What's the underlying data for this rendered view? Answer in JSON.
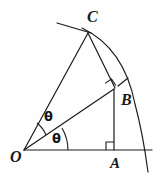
{
  "figure": {
    "stroke_color": "#1a1a1a",
    "background_color": "#fefefe",
    "width": 157,
    "height": 176,
    "points": [
      {
        "name": "O",
        "label": "O",
        "x": 24,
        "y": 150,
        "role": "origin-vertex"
      },
      {
        "name": "C",
        "label": "C",
        "x": 88,
        "y": 33,
        "role": "arc-point-outer"
      },
      {
        "name": "B",
        "label": "B",
        "x": 114,
        "y": 89,
        "role": "foot-of-perpendicular"
      },
      {
        "name": "A",
        "label": "A",
        "x": 114,
        "y": 150,
        "role": "foot-on-baseline"
      }
    ],
    "angles": [
      {
        "name": "theta-upper",
        "label": "θ",
        "vertex": "O",
        "between": "OB-and-OC"
      },
      {
        "name": "theta-lower",
        "label": "θ",
        "vertex": "O",
        "between": "OA-and-OB"
      }
    ],
    "right_angles": [
      {
        "name": "right-angle-at-A",
        "at": "A",
        "marker": "square"
      },
      {
        "name": "right-angle-at-B",
        "at": "B",
        "marker": "square"
      }
    ],
    "segments": [
      {
        "name": "segment-OC",
        "from": "O",
        "to": "C"
      },
      {
        "name": "segment-OB",
        "from": "O",
        "to": "B"
      },
      {
        "name": "segment-OA",
        "from": "O",
        "to": "A",
        "extends_past": true
      },
      {
        "name": "segment-CB",
        "from": "C",
        "to": "B"
      },
      {
        "name": "segment-BA",
        "from": "B",
        "to": "A"
      }
    ],
    "arcs": [
      {
        "name": "circular-arc-through-C",
        "from": "C",
        "to_baseline_x": 148,
        "tick_marked": true
      },
      {
        "name": "tangent-at-C",
        "from_x": 57,
        "from_y": 23,
        "to_x": 107,
        "to_y": 38
      }
    ]
  }
}
